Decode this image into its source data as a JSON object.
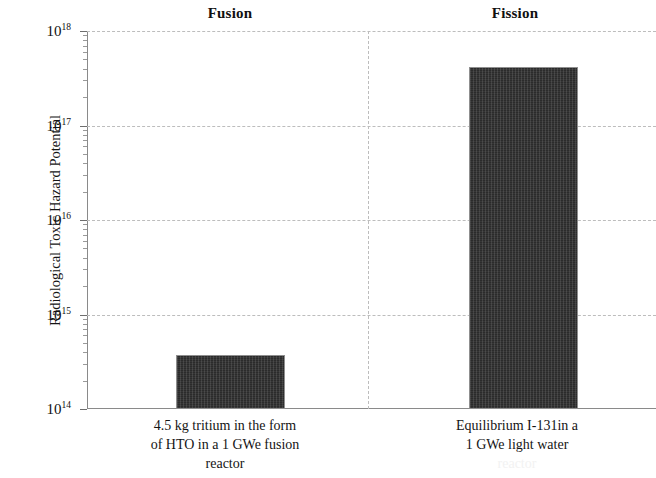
{
  "figure": {
    "y_axis_title": "Radiological Toxic Hazard Potential",
    "group_headers": [
      {
        "label": "Fusion"
      },
      {
        "label": "Fission"
      }
    ],
    "tick_labels": [
      {
        "mantissa": "10",
        "exponent": "18"
      },
      {
        "mantissa": "10",
        "exponent": "17"
      },
      {
        "mantissa": "10",
        "exponent": "16"
      },
      {
        "mantissa": "10",
        "exponent": "15"
      },
      {
        "mantissa": "10",
        "exponent": "14"
      }
    ],
    "captions": {
      "fusion_line1": "4.5 kg tritium in the form",
      "fusion_line2": "of HTO in a 1 GWe fusion",
      "fusion_line3": "reactor",
      "fission_line1": "Equilibrium I-131in a",
      "fission_line2": "1 GWe light water",
      "fission_line3": "reactor"
    },
    "colors": {
      "bar_fill": "#2b2b2b",
      "bar_edge": "#8f8f8f",
      "gridline": "#bdbdbd",
      "axis": "#8a8a8a",
      "background": "#ffffff"
    }
  },
  "chart_data": {
    "type": "bar",
    "title": "",
    "xlabel": "",
    "ylabel": "Radiological Toxic Hazard Potential",
    "yscale": "log",
    "ylim": [
      100000000000000.0,
      1e+18
    ],
    "ytick_values": [
      100000000000000.0,
      1000000000000000.0,
      1e+16,
      1e+17,
      1e+18
    ],
    "ytick_labels": [
      "10^14",
      "10^15",
      "10^16",
      "10^17",
      "10^18"
    ],
    "grid": "horizontal dashed gridlines at each decade; dashed vertical divider separating the two groups",
    "legend": "none",
    "group_labels": [
      "Fusion",
      "Fission"
    ],
    "categories": [
      "4.5 kg tritium in the form of HTO in a 1 GWe fusion reactor",
      "Equilibrium I-131in a 1 GWe light water reactor"
    ],
    "values": [
      370000000000000.0,
      4.2e+17
    ],
    "values_log10": [
      14.57,
      17.62
    ],
    "series": [
      {
        "name": "Radiological Toxic Hazard Potential",
        "values": [
          370000000000000.0,
          4.2e+17
        ]
      }
    ],
    "annotations": [
      "Fission bar is roughly three orders of magnitude larger than the fusion bar."
    ]
  }
}
